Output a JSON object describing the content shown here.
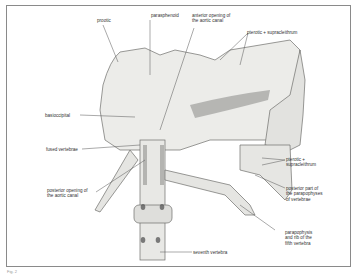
{
  "figure": {
    "caption": "Fig. 2",
    "labels": {
      "prootic": "prootic",
      "parasphenoid": "parasphenoid",
      "anterior_opening": "anterior opening of\nthe aortic canal",
      "pterotic_top": "pterotic + supracleithrum",
      "basioccipital": "basioccipital",
      "fused_vertebrae": "fused vertebrae",
      "pterotic_right": "pterotic +\nsupracleithrum",
      "posterior_part": "posterior part of\nthe parapophyses\nof vertebrae",
      "posterior_opening": "posterior opening of\nthe aortic canal",
      "parapophysis": "parapophysis\nand rib of the\nfifth vertebra",
      "seventh_vertebra": "seventh vertebra"
    },
    "colors": {
      "ink": "#333333",
      "bone_fill": "#e9e9e6",
      "shadow": "#7a7a78",
      "frame": "#8a8a8a"
    }
  }
}
